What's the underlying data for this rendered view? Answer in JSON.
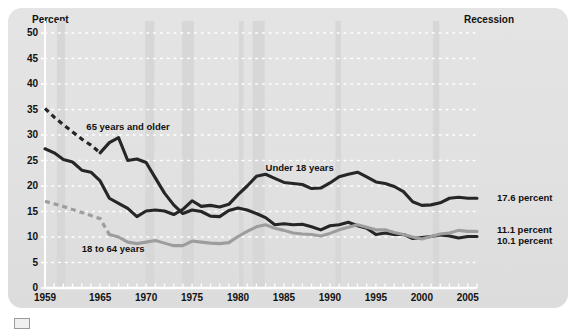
{
  "panel": {
    "recession_note": "Recession",
    "background_color": "#e2e2e2"
  },
  "chart_data": {
    "type": "line",
    "title": "",
    "subtitle": "",
    "xlabel": "",
    "ylabel": "Percent",
    "ylim": [
      0,
      50
    ],
    "xlim": [
      1959,
      2006
    ],
    "grid": true,
    "grid_style": "dotted-horizontal-white",
    "legend_position": "inline-labels",
    "yticks": [
      0,
      5,
      10,
      15,
      20,
      25,
      30,
      35,
      40,
      45,
      50
    ],
    "xticks": [
      1959,
      1965,
      1970,
      1975,
      1980,
      1985,
      1990,
      1995,
      2000,
      2005
    ],
    "xtick_minor_every": 1,
    "annotations": [
      {
        "text": "Recession",
        "position": "top-right"
      },
      {
        "text": "65 years and older",
        "x": 1963.5,
        "y": 31.5
      },
      {
        "text": "Under 18 years",
        "x": 1983.0,
        "y": 23.5
      },
      {
        "text": "18 to 64 years",
        "x": 1963.0,
        "y": 7.6
      }
    ],
    "end_labels": [
      {
        "text": "17.6 percent",
        "series": "Under 18 years",
        "color": "#2e2e2e"
      },
      {
        "text": "11.1 percent",
        "series": "18 to 64 years",
        "color": "#2e2e2e"
      },
      {
        "text": "10.1 percent",
        "series": "65 years and older",
        "color": "#2e2e2e"
      }
    ],
    "series": [
      {
        "name": "65 years and older",
        "color": "#262626",
        "dashed_prefix_years": [
          1959,
          1965
        ],
        "x": [
          1959,
          1960,
          1961,
          1962,
          1963,
          1964,
          1965,
          1966,
          1967,
          1968,
          1969,
          1970,
          1971,
          1972,
          1973,
          1974,
          1975,
          1976,
          1977,
          1978,
          1979,
          1980,
          1981,
          1982,
          1983,
          1984,
          1985,
          1986,
          1987,
          1988,
          1989,
          1990,
          1991,
          1992,
          1993,
          1994,
          1995,
          1996,
          1997,
          1998,
          1999,
          2000,
          2001,
          2002,
          2003,
          2004,
          2005,
          2006
        ],
        "values": [
          35.2,
          33.5,
          32.0,
          30.6,
          29.2,
          28.0,
          26.5,
          28.5,
          29.5,
          25.0,
          25.3,
          24.6,
          21.6,
          18.6,
          16.3,
          14.6,
          15.3,
          15.0,
          14.1,
          14.0,
          15.2,
          15.7,
          15.3,
          14.6,
          13.8,
          12.4,
          12.6,
          12.4,
          12.5,
          12.0,
          11.4,
          12.2,
          12.4,
          12.9,
          12.2,
          11.7,
          10.5,
          10.8,
          10.5,
          10.5,
          9.7,
          9.9,
          10.1,
          10.4,
          10.2,
          9.8,
          10.1,
          10.1
        ]
      },
      {
        "name": "Under 18 years",
        "color": "#262626",
        "dashed_prefix_years": [],
        "x": [
          1959,
          1960,
          1961,
          1962,
          1963,
          1964,
          1965,
          1966,
          1967,
          1968,
          1969,
          1970,
          1971,
          1972,
          1973,
          1974,
          1975,
          1976,
          1977,
          1978,
          1979,
          1980,
          1981,
          1982,
          1983,
          1984,
          1985,
          1986,
          1987,
          1988,
          1989,
          1990,
          1991,
          1992,
          1993,
          1994,
          1995,
          1996,
          1997,
          1998,
          1999,
          2000,
          2001,
          2002,
          2003,
          2004,
          2005,
          2006
        ],
        "values": [
          27.3,
          26.5,
          25.2,
          24.7,
          23.1,
          22.7,
          21.0,
          17.6,
          16.6,
          15.6,
          14.0,
          15.1,
          15.3,
          15.1,
          14.4,
          15.4,
          17.1,
          16.0,
          16.2,
          15.9,
          16.4,
          18.3,
          20.0,
          21.9,
          22.3,
          21.5,
          20.7,
          20.5,
          20.3,
          19.5,
          19.6,
          20.6,
          21.8,
          22.3,
          22.7,
          21.8,
          20.8,
          20.5,
          19.9,
          18.9,
          16.9,
          16.2,
          16.3,
          16.7,
          17.6,
          17.8,
          17.6,
          17.6
        ]
      },
      {
        "name": "18 to 64 years",
        "color": "#9d9d9d",
        "dashed_prefix_years": [
          1959,
          1966
        ],
        "x": [
          1959,
          1960,
          1961,
          1962,
          1963,
          1964,
          1965,
          1966,
          1967,
          1968,
          1969,
          1970,
          1971,
          1972,
          1973,
          1974,
          1975,
          1976,
          1977,
          1978,
          1979,
          1980,
          1981,
          1982,
          1983,
          1984,
          1985,
          1986,
          1987,
          1988,
          1989,
          1990,
          1991,
          1992,
          1993,
          1994,
          1995,
          1996,
          1997,
          1998,
          1999,
          2000,
          2001,
          2002,
          2003,
          2004,
          2005,
          2006
        ],
        "values": [
          17.0,
          16.5,
          16.0,
          15.4,
          14.8,
          14.2,
          13.6,
          10.5,
          10.0,
          9.0,
          8.7,
          9.0,
          9.3,
          8.8,
          8.3,
          8.3,
          9.2,
          9.0,
          8.8,
          8.7,
          8.9,
          10.1,
          11.1,
          12.0,
          12.4,
          11.7,
          11.3,
          10.8,
          10.6,
          10.5,
          10.2,
          10.7,
          11.4,
          11.9,
          12.4,
          11.9,
          11.4,
          11.4,
          10.9,
          10.5,
          10.0,
          9.6,
          10.1,
          10.6,
          10.8,
          11.3,
          11.1,
          11.1
        ]
      }
    ],
    "recession_bands": [
      {
        "start": 1960.3,
        "end": 1961.2
      },
      {
        "start": 1969.9,
        "end": 1970.9
      },
      {
        "start": 1973.9,
        "end": 1975.2
      },
      {
        "start": 1980.1,
        "end": 1980.6
      },
      {
        "start": 1981.6,
        "end": 1982.9
      },
      {
        "start": 1990.6,
        "end": 1991.2
      },
      {
        "start": 2001.2,
        "end": 2001.9
      }
    ]
  }
}
